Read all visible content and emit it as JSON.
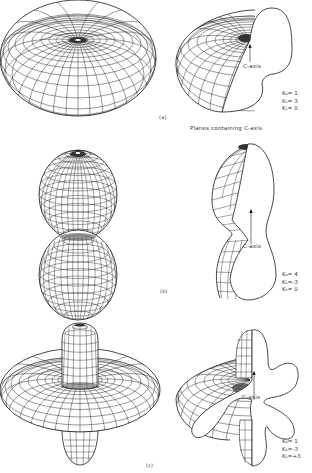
{
  "figure": {
    "panels": [
      {
        "id": "a",
        "label": "(a)",
        "shape": "oblate torus-like (doughnut) surface",
        "cut_label": "C-axis",
        "params": [
          {
            "name": "K0",
            "value": "1"
          },
          {
            "name": "K1",
            "value": "3"
          },
          {
            "name": "K2",
            "value": "0"
          }
        ]
      },
      {
        "id": "b",
        "label": "(b)",
        "shape": "two stacked lobes (peanut) along C-axis",
        "cut_label": "C-axis",
        "params": [
          {
            "name": "K0",
            "value": "4"
          },
          {
            "name": "K1",
            "value": "-3"
          },
          {
            "name": "K2",
            "value": "0"
          }
        ]
      },
      {
        "id": "c",
        "label": "(c)",
        "shape": "torus with polar lobes",
        "cut_label": "C-axis",
        "params": [
          {
            "name": "K0",
            "value": "1"
          },
          {
            "name": "K1",
            "value": "-3"
          },
          {
            "name": "K2",
            "value": "3"
          }
        ]
      }
    ],
    "caption_right_column": "Planes containing C-axis",
    "text": {
      "a_label": "(a)",
      "b_label": "(b)",
      "c_label": "(c)",
      "planes_caption": "Planes containing C-axis",
      "a_cut": "C-axis",
      "b_cut": "C-axis",
      "c_cut": "C-axis",
      "a_k0": "K₀= 1",
      "a_k1": "K₁= 3",
      "a_k2": "K₂= 0",
      "b_k0": "K₀= 4",
      "b_k1": "K₁=-3",
      "b_k2": "K₂= 0",
      "c_k0": "K₀= 1",
      "c_k1": "K₁=-3",
      "c_k2": "K₂=+3"
    },
    "colors": {
      "mesh_line": "#1a1a1a",
      "background": "#ffffff",
      "cut_face": "#ffffff"
    }
  }
}
